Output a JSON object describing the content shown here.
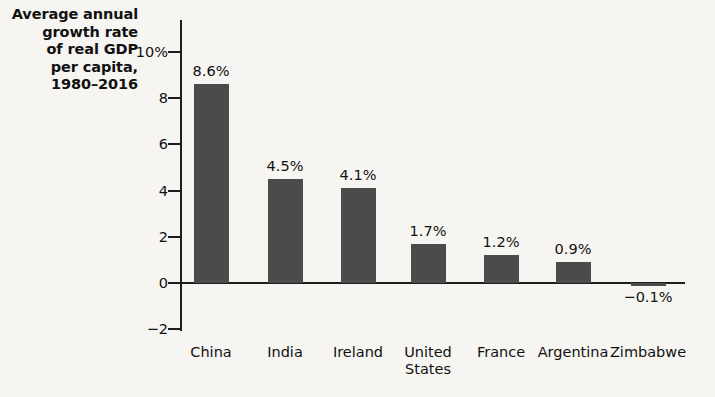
{
  "chart_data": {
    "type": "bar",
    "title": "Average annual growth rate of real GDP per capita, 1980–2016",
    "title_lines": [
      "Average annual",
      "growth rate",
      "of real GDP",
      "per capita,",
      "1980–2016"
    ],
    "xlabel": "",
    "ylabel": "",
    "categories": [
      "China",
      "India",
      "Ireland",
      "United States",
      "France",
      "Argentina",
      "Zimbabwe"
    ],
    "category_lines": [
      [
        "China"
      ],
      [
        "India"
      ],
      [
        "Ireland"
      ],
      [
        "United",
        "States"
      ],
      [
        "France"
      ],
      [
        "Argentina"
      ],
      [
        "Zimbabwe"
      ]
    ],
    "values": [
      8.6,
      4.5,
      4.1,
      1.7,
      1.2,
      0.9,
      -0.1
    ],
    "value_labels": [
      "8.6%",
      "4.5%",
      "4.1%",
      "1.7%",
      "1.2%",
      "0.9%",
      "−0.1%"
    ],
    "ylim": [
      -2,
      10
    ],
    "yticks": [
      10,
      8,
      6,
      4,
      2,
      0,
      -2
    ],
    "ytick_labels": [
      "10%",
      "8",
      "6",
      "4",
      "2",
      "0",
      "−2"
    ],
    "grid": false,
    "legend": null,
    "bar_color": "#4b4b4b",
    "text_color": "#111111",
    "background_color": "#f6f5f1",
    "axis_color": "#1c1c1c",
    "units": "percent"
  }
}
